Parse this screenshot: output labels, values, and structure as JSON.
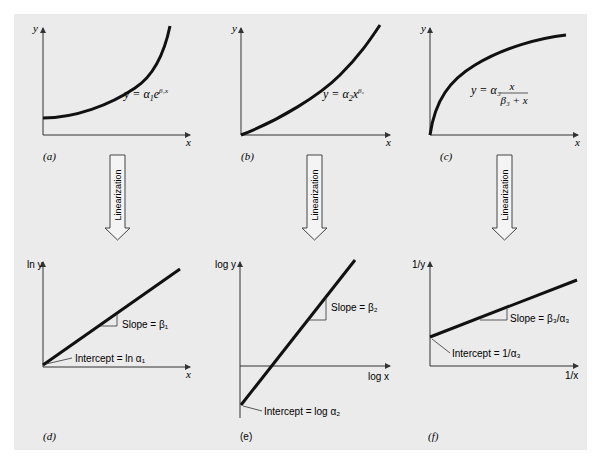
{
  "figure": {
    "panels": [
      {
        "id": "a",
        "label": "(a)",
        "xlabel": "x",
        "ylabel": "y",
        "equation": "y = α₁e^(β₁x)",
        "curve": "exponential"
      },
      {
        "id": "b",
        "label": "(b)",
        "xlabel": "x",
        "ylabel": "y",
        "equation": "y = α₂x^(β₂)",
        "curve": "power"
      },
      {
        "id": "c",
        "label": "(c)",
        "xlabel": "x",
        "ylabel": "y",
        "equation": "y = α₃ x / (β₃ + x)",
        "curve": "saturation-growth"
      },
      {
        "id": "d",
        "label": "(d)",
        "xlabel": "x",
        "ylabel": "ln y",
        "slope": "Slope = β₁",
        "intercept": "Intercept = ln α₁"
      },
      {
        "id": "e",
        "label": "(e)",
        "xlabel": "log x",
        "ylabel": "log y",
        "slope": "Slope = β₂",
        "intercept": "Intercept = log α₂"
      },
      {
        "id": "f",
        "label": "(f)",
        "xlabel": "1/x",
        "ylabel": "1/y",
        "slope": "Slope = β₃/α₃",
        "intercept": "Intercept = 1/α₃"
      }
    ],
    "arrow_label": "Linearization",
    "text": {
      "a_label": "(a)",
      "b_label": "(b)",
      "c_label": "(c)",
      "d_label": "(d)",
      "e_label": "(e)",
      "f_label": "(f)",
      "x": "x",
      "y": "y",
      "lny": "ln y",
      "logy": "log y",
      "logx": "log x",
      "invy": "1/y",
      "invx": "1/x",
      "eq_a_main": "y = α",
      "eq_a_sub": "1",
      "eq_a_e": "e",
      "eq_a_sup": "β₁x",
      "eq_b_main": "y = α",
      "eq_b_sub": "2",
      "eq_b_x": "x",
      "eq_b_sup": "β₂",
      "eq_c_main": "y = α₃",
      "eq_c_num": "x",
      "eq_c_den": "β₃ + x",
      "slope_d": "Slope = β₁",
      "int_d": "Intercept = ln α₁",
      "slope_e": "Slope = β₂",
      "int_e": "Intercept = log α₂",
      "slope_f": "Slope = β₃/α₃",
      "int_f": "Intercept = 1/α₃",
      "arrow": "Linearization"
    }
  }
}
